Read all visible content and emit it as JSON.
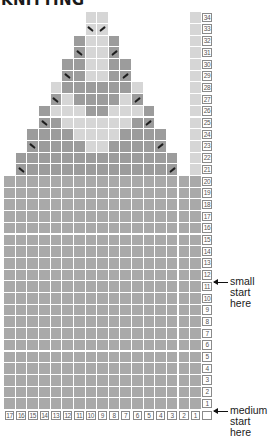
{
  "title": "KNITTING",
  "chart_data": {
    "type": "table",
    "title": "KNITTING",
    "columns": 17,
    "rows": 34,
    "column_labels": [
      "17",
      "16",
      "15",
      "14",
      "13",
      "12",
      "11",
      "10",
      "9",
      "8",
      "7",
      "6",
      "5",
      "4",
      "3",
      "2",
      "1"
    ],
    "row_labels": [
      "34",
      "33",
      "32",
      "31",
      "30",
      "29",
      "28",
      "27",
      "26",
      "25",
      "24",
      "23",
      "22",
      "21",
      "20",
      "19",
      "18",
      "17",
      "16",
      "15",
      "14",
      "13",
      "12",
      "11",
      "10",
      "9",
      "8",
      "7",
      "6",
      "5",
      "4",
      "3",
      "2",
      "1"
    ],
    "shape_rows": [
      {
        "row": 34,
        "from": 7,
        "to": 8,
        "shades": "LL",
        "marks": {}
      },
      {
        "row": 33,
        "from": 7,
        "to": 8,
        "shades": "LL",
        "marks": {
          "7": "left",
          "8": "right"
        }
      },
      {
        "row": 32,
        "from": 6,
        "to": 9,
        "shades": "DLLD",
        "marks": {}
      },
      {
        "row": 31,
        "from": 6,
        "to": 9,
        "shades": "DLLD",
        "marks": {
          "6": "left",
          "9": "right"
        }
      },
      {
        "row": 30,
        "from": 5,
        "to": 10,
        "shades": "DDLLDD",
        "marks": {}
      },
      {
        "row": 29,
        "from": 5,
        "to": 10,
        "shades": "DDLLDD",
        "marks": {
          "5": "left",
          "10": "right"
        }
      },
      {
        "row": 28,
        "from": 4,
        "to": 11,
        "shades": "LDDDDDDL",
        "marks": {}
      },
      {
        "row": 27,
        "from": 4,
        "to": 11,
        "shades": "DLDDDDLD",
        "marks": {
          "4": "left",
          "11": "right"
        }
      },
      {
        "row": 26,
        "from": 3,
        "to": 12,
        "shades": "DLLLDDLLLD",
        "marks": {}
      },
      {
        "row": 25,
        "from": 3,
        "to": 12,
        "shades": "DDLLLLLLDD",
        "marks": {
          "3": "left",
          "12": "right"
        }
      },
      {
        "row": 24,
        "from": 2,
        "to": 13,
        "shades": "DDDDLLLLDDDD",
        "marks": {}
      },
      {
        "row": 23,
        "from": 2,
        "to": 13,
        "shades": "DDDDDLLDDDDD",
        "marks": {
          "2": "left",
          "13": "right"
        }
      },
      {
        "row": 22,
        "from": 1,
        "to": 14,
        "shades": "DDDDDDDDDDDDDD",
        "marks": {}
      },
      {
        "row": 21,
        "from": 1,
        "to": 14,
        "shades": "DDDDDDDDDDDDDD",
        "marks": {
          "1": "left",
          "14": "right"
        }
      }
    ],
    "full_rows": {
      "from_row": 1,
      "to_row": 20,
      "shade": "M"
    },
    "edge_column": {
      "index": 16,
      "upper_shade": "L",
      "lower_shade": "M",
      "split_row": 20
    },
    "legend": {
      "L": "#d6d6d6",
      "D": "#a4a4a4",
      "M": "#a9a9a9"
    },
    "annotations": [
      {
        "row": 12,
        "text": "small start here"
      },
      {
        "row": 1,
        "text": "medium start here"
      }
    ]
  },
  "annotations": {
    "small": {
      "line1": "small",
      "line2": "start here"
    },
    "medium": {
      "line1": "medium",
      "line2": "start here"
    }
  }
}
